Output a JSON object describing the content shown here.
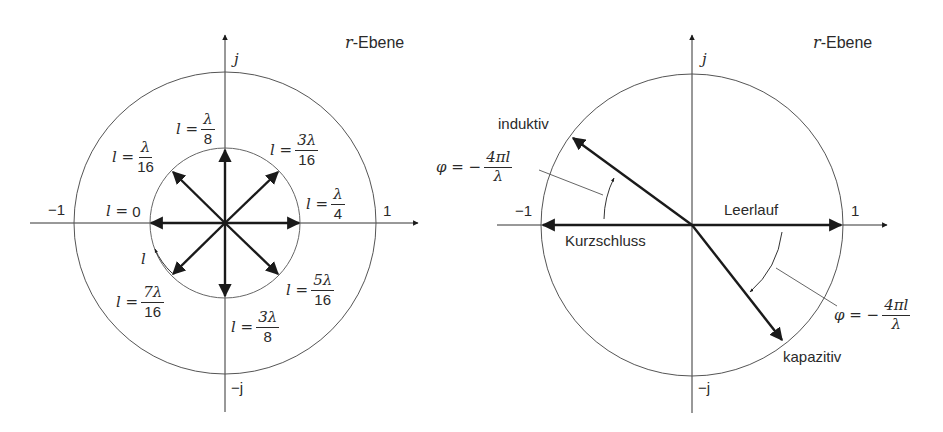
{
  "left_diagram": {
    "plane_label_var": "r",
    "plane_label_text": "-Ebene",
    "axis_j": "j",
    "axis_minus_j": "−j",
    "axis_minus_one": "−1",
    "axis_one": "1",
    "rotation_label": "l",
    "positions": [
      {
        "lhs": "l =",
        "value": "0"
      },
      {
        "lhs": "l =",
        "num": "λ",
        "den": "16"
      },
      {
        "lhs": "l =",
        "num": "λ",
        "den": "8"
      },
      {
        "lhs": "l =",
        "num": "3λ",
        "den": "16"
      },
      {
        "lhs": "l =",
        "num": "λ",
        "den": "4"
      },
      {
        "lhs": "l =",
        "num": "5λ",
        "den": "16"
      },
      {
        "lhs": "l =",
        "num": "3λ",
        "den": "8"
      },
      {
        "lhs": "l =",
        "num": "7λ",
        "den": "16"
      }
    ]
  },
  "right_diagram": {
    "plane_label_var": "r",
    "plane_label_text": "-Ebene",
    "axis_j": "j",
    "axis_minus_j": "−j",
    "axis_minus_one": "−1",
    "axis_one": "1",
    "inductive_label": "induktiv",
    "capacitive_label": "kapazitiv",
    "short_circuit_label": "Kurzschluss",
    "open_circuit_label": "Leerlauf",
    "phase_formula_lhs": "φ = −",
    "phase_formula_num": "4πl",
    "phase_formula_den": "λ"
  },
  "colors": {
    "line": "#1a1a1a",
    "circle": "#555555",
    "background": "#ffffff"
  }
}
